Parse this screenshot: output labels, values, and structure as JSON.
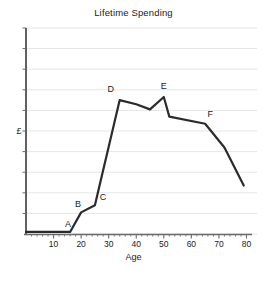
{
  "chart_data": {
    "type": "line",
    "title": "Lifetime Spending",
    "xlabel": "Age",
    "ylabel": "£",
    "xlim": [
      0,
      82
    ],
    "ylim": [
      0,
      10
    ],
    "grid": true,
    "legend": null,
    "xticks": [
      "10",
      "20",
      "30",
      "40",
      "50",
      "60",
      "70",
      "80"
    ],
    "xtick_values": [
      10,
      20,
      30,
      40,
      50,
      60,
      70,
      80
    ],
    "yticks": [],
    "x": [
      0,
      16,
      20,
      25,
      34,
      40,
      45,
      50,
      52,
      65,
      72,
      79
    ],
    "values": [
      0.1,
      0.1,
      1.05,
      1.4,
      6.5,
      6.3,
      6.05,
      6.65,
      5.7,
      5.35,
      4.2,
      2.35
    ],
    "series": [
      {
        "name": "Lifetime Spending",
        "x": [
          0,
          16,
          20,
          25,
          34,
          40,
          45,
          50,
          52,
          65,
          72,
          79
        ],
        "values": [
          0.1,
          0.1,
          1.05,
          1.4,
          6.5,
          6.3,
          6.05,
          6.65,
          5.7,
          5.35,
          4.2,
          2.35
        ]
      }
    ],
    "annotations": [
      {
        "label": "A",
        "x": 16,
        "y": 0.1
      },
      {
        "label": "B",
        "x": 20,
        "y": 1.05
      },
      {
        "label": "C",
        "x": 25,
        "y": 1.4
      },
      {
        "label": "D",
        "x": 34,
        "y": 6.5
      },
      {
        "label": "E",
        "x": 50,
        "y": 6.65
      },
      {
        "label": "F",
        "x": 65,
        "y": 5.35
      }
    ],
    "colors": {
      "line": "#2b2b2b",
      "axis": "#3a3a3a",
      "grid": "#e6e6e6",
      "background": "#ffffff",
      "text": "#222222"
    }
  },
  "labels": {
    "title": "Lifetime Spending",
    "xlabel": "Age",
    "ylabel": "£",
    "xticks": [
      "10",
      "20",
      "30",
      "40",
      "50",
      "60",
      "70",
      "80"
    ],
    "points": [
      "A",
      "B",
      "C",
      "D",
      "E",
      "F"
    ]
  }
}
